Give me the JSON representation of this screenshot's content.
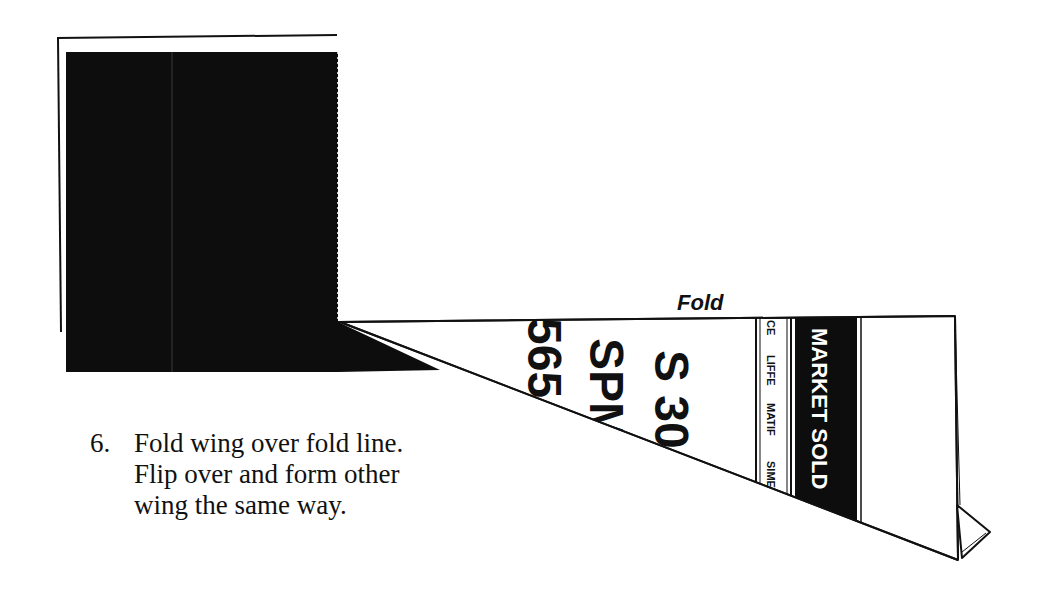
{
  "diagram": {
    "step_number": "6.",
    "instruction_lines": [
      "Fold wing over fold line.",
      "Flip over and form other",
      "wing the same way."
    ],
    "fold_label": "Fold",
    "wing_print": {
      "big_text": [
        "565",
        "SPM",
        "S 30"
      ],
      "exchange_strip": [
        "CE",
        "LIFFE",
        "MATIF",
        "SIMEX"
      ],
      "banner_text": "MARKET SOLD"
    },
    "colors": {
      "ink": "#111111",
      "paper": "#ffffff",
      "dark_panel": "#0d0d0d"
    }
  }
}
